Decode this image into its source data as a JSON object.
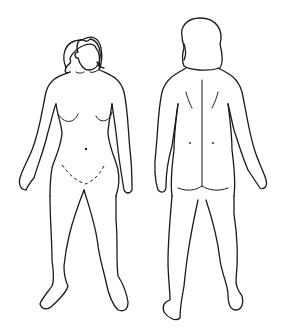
{
  "diagram": {
    "type": "body-outline",
    "figures": [
      {
        "id": "front",
        "view": "front view",
        "label": ""
      },
      {
        "id": "back",
        "view": "back view",
        "label": ""
      }
    ],
    "colors": {
      "line": "#1a1a1a",
      "background": "#ffffff"
    }
  }
}
